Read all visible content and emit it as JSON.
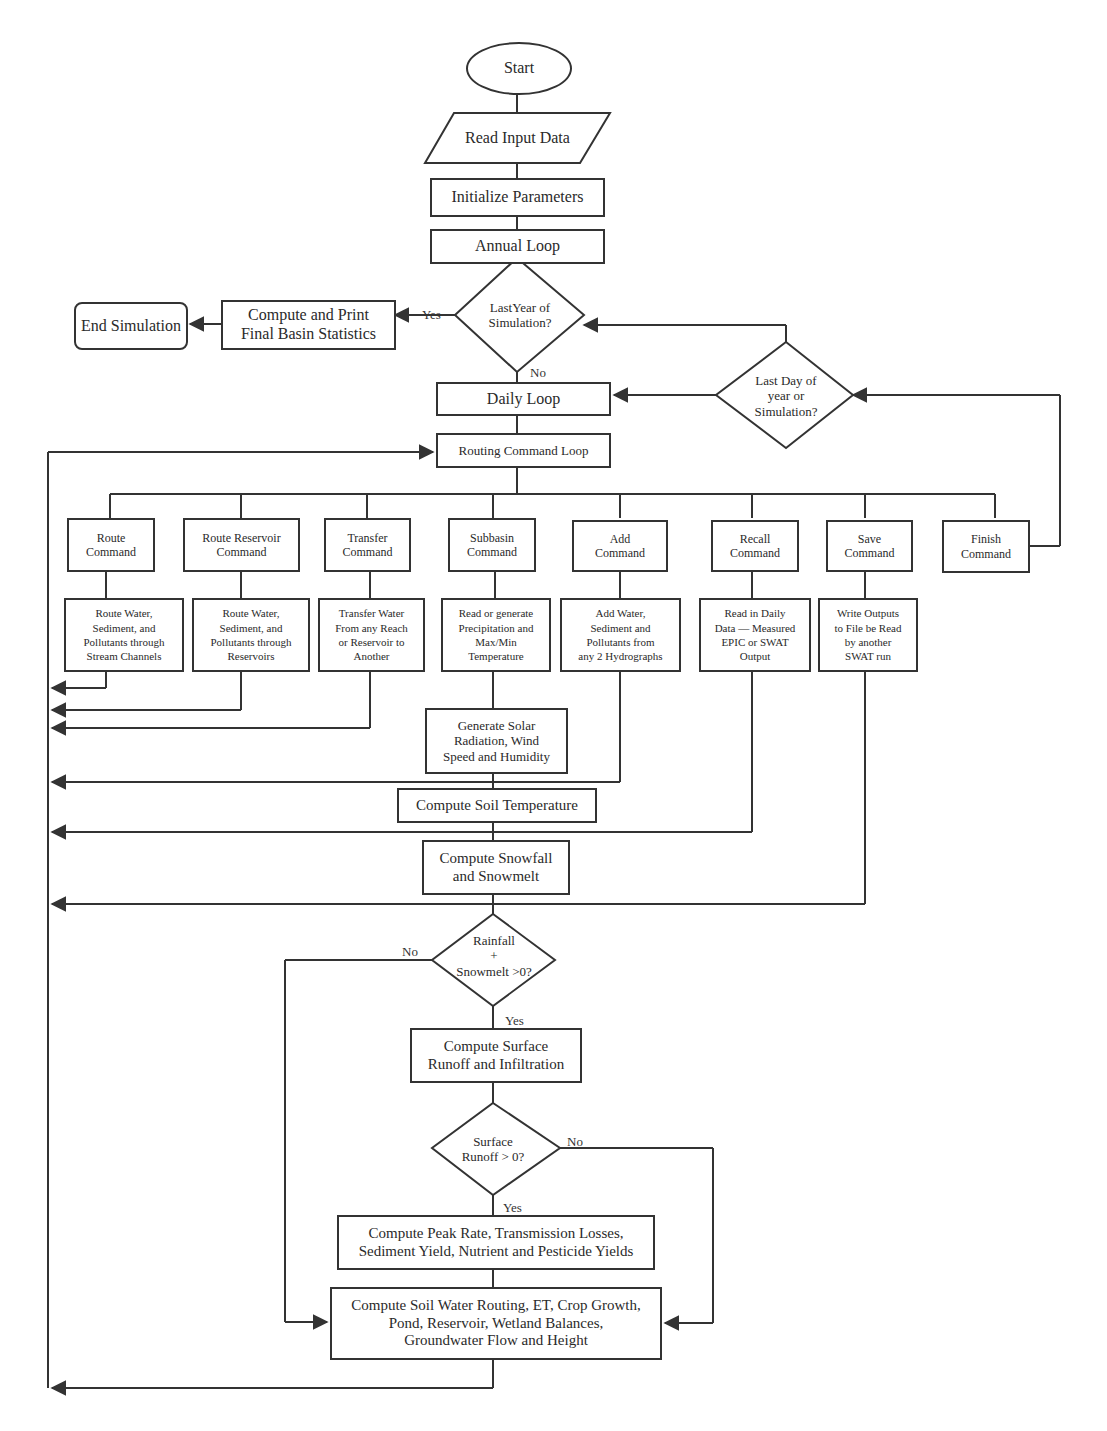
{
  "start": "Start",
  "read_input": "Read Input Data",
  "initialize": "Initialize Parameters",
  "annual_loop": "Annual Loop",
  "last_year": "LastYear of\nSimulation?",
  "compute_print": "Compute and Print\nFinal Basin Statistics",
  "end_sim": "End Simulation",
  "daily_loop": "Daily Loop",
  "last_day": "Last Day of\nyear or\nSimulation?",
  "routing_loop": "Routing Command Loop",
  "commands": [
    {
      "title": "Route\nCommand",
      "detail": "Route Water,\nSediment, and\nPollutants through\nStream Channels"
    },
    {
      "title": "Route Reservoir\nCommand",
      "detail": "Route Water,\nSediment, and\nPollutants through\nReservoirs"
    },
    {
      "title": "Transfer\nCommand",
      "detail": "Transfer Water\nFrom any Reach\nor Reservoir to\nAnother"
    },
    {
      "title": "Subbasin\nCommand",
      "detail": "Read or generate\nPrecipitation and\nMax/Min\nTemperature"
    },
    {
      "title": "Add\nCommand",
      "detail": "Add Water,\nSediment and\nPollutants from\nany 2 Hydrographs"
    },
    {
      "title": "Recall\nCommand",
      "detail": "Read in Daily\nData — Measured\nEPIC or SWAT\nOutput"
    },
    {
      "title": "Save\nCommand",
      "detail": "Write Outputs\nto File be Read\nby another\nSWAT run"
    },
    {
      "title": "Finish\nCommand"
    }
  ],
  "gen_solar": "Generate Solar\nRadiation, Wind\nSpeed and Humidity",
  "soil_temp": "Compute Soil Temperature",
  "snowfall": "Compute Snowfall\nand Snowmelt",
  "rainfall_q": "Rainfall\n+\nSnowmelt >0?",
  "surface_runoff": "Compute Surface\nRunoff and Infiltration",
  "runoff_q": "Surface\nRunoff > 0?",
  "peak_rate": "Compute Peak Rate, Transmission Losses,\nSediment Yield, Nutrient and Pesticide Yields",
  "soil_water": "Compute Soil Water Routing, ET, Crop Growth,\nPond, Reservoir, Wetland Balances,\nGroundwater Flow and   Height",
  "labels": {
    "yes": "Yes",
    "no": "No"
  }
}
